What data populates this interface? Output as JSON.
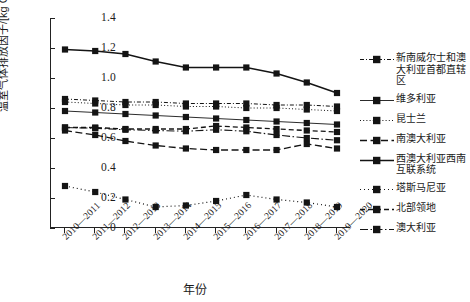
{
  "chart_data": {
    "type": "line",
    "title": "",
    "xlabel": "年份",
    "ylabel": "温室气体排放因子/[kg CO2e/(kW·h)]",
    "ylabel_main": "温室气体排放因子/[kg CO",
    "ylabel_sub": "2",
    "ylabel_tail": "e/(kW·h)]",
    "categories": [
      "2010—2011",
      "2011—2012",
      "2012—2013",
      "2013—2014",
      "2014—2015",
      "2015—2016",
      "2016—2017",
      "2017—2018",
      "2018—2019",
      "2019—2020"
    ],
    "ylim": [
      0,
      1.4
    ],
    "yticks": [
      "0",
      "0.2",
      "0.4",
      "0.6",
      "0.8",
      "1.0",
      "1.2",
      "1.4"
    ],
    "ytick_values": [
      0,
      0.2,
      0.4,
      0.6,
      0.8,
      1.0,
      1.2,
      1.4
    ],
    "grid": false,
    "legend_position": "right",
    "series": [
      {
        "name": "新南威尔士和澳大利亚首都直辖区",
        "style": "dash-dot-short",
        "values": [
          0.86,
          0.85,
          0.84,
          0.84,
          0.83,
          0.83,
          0.83,
          0.82,
          0.82,
          0.81
        ]
      },
      {
        "name": "维多利亚",
        "style": "solid-thin",
        "values": [
          0.78,
          0.77,
          0.76,
          0.75,
          0.74,
          0.73,
          0.72,
          0.71,
          0.7,
          0.69
        ]
      },
      {
        "name": "昆士兰",
        "style": "dotted",
        "values": [
          0.84,
          0.83,
          0.82,
          0.82,
          0.81,
          0.81,
          0.8,
          0.8,
          0.79,
          0.78
        ]
      },
      {
        "name": "南澳大利亚",
        "style": "dash-long",
        "values": [
          0.65,
          0.62,
          0.58,
          0.55,
          0.53,
          0.52,
          0.52,
          0.52,
          0.56,
          0.53
        ]
      },
      {
        "name": "西澳大利亚西南互联系统",
        "style": "solid-thick",
        "values": [
          1.19,
          1.18,
          1.16,
          1.11,
          1.07,
          1.07,
          1.07,
          1.03,
          0.97,
          0.9
        ]
      },
      {
        "name": "塔斯马尼亚",
        "style": "dotted-round",
        "values": [
          0.28,
          0.24,
          0.19,
          0.14,
          0.15,
          0.18,
          0.22,
          0.19,
          0.17,
          0.14
        ]
      },
      {
        "name": "北部领地",
        "style": "dash-medium",
        "values": [
          0.67,
          0.67,
          0.66,
          0.66,
          0.66,
          0.68,
          0.67,
          0.66,
          0.65,
          0.64
        ]
      },
      {
        "name": "澳大利亚",
        "style": "dash-dot-long",
        "values": [
          0.67,
          0.665,
          0.655,
          0.65,
          0.645,
          0.655,
          0.645,
          0.62,
          0.6,
          0.585
        ]
      }
    ]
  }
}
